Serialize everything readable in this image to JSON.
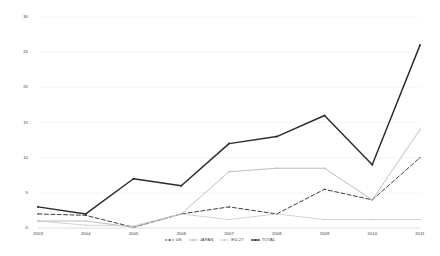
{
  "chart_data": {
    "type": "line",
    "title": "",
    "subtitle": "",
    "xlabel": "",
    "ylabel": "",
    "categories": [
      "2003",
      "2004",
      "2005",
      "2006",
      "2007",
      "2008",
      "2009",
      "2010",
      "2011"
    ],
    "ylim": [
      0,
      30
    ],
    "yticks": [
      0,
      5,
      10,
      15,
      20,
      25,
      30
    ],
    "ytick_labels": [
      "0",
      "5",
      "10",
      "15",
      "20",
      "25",
      "30"
    ],
    "grid": "horizontal",
    "legend_position": "bottom-center",
    "series": [
      {
        "name": "US",
        "style": "dashed",
        "color": "#3f3f3f",
        "values": [
          2,
          1.8,
          0.1,
          2,
          3,
          2,
          5.5,
          4,
          10
        ]
      },
      {
        "name": "JAPAN",
        "style": "solid",
        "color": "#b4b4b4",
        "values": [
          1,
          1,
          0.1,
          2,
          8,
          8.5,
          8.5,
          4,
          14
        ]
      },
      {
        "name": "EU-27",
        "style": "solid",
        "color": "#c8c8c8",
        "values": [
          1,
          0.4,
          0.3,
          2,
          1.2,
          2,
          1.2,
          1.2,
          1.2
        ]
      },
      {
        "name": "TOTAL",
        "style": "solid",
        "color": "#2b2b2b",
        "values": [
          3,
          2,
          7,
          6,
          12,
          13,
          16,
          9,
          26
        ]
      }
    ]
  },
  "legend": {
    "items": [
      {
        "label": "US"
      },
      {
        "label": "JAPAN"
      },
      {
        "label": "EU-27"
      },
      {
        "label": "TOTAL"
      }
    ]
  }
}
